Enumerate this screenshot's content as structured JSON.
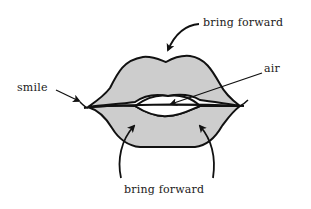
{
  "diagram": {
    "labels": {
      "top": "bring forward",
      "air": "air",
      "smile": "smile",
      "bottom": "bring forward"
    },
    "colors": {
      "lip_fill": "#cfcfcf",
      "outline": "#111111",
      "mouth_opening": "#ffffff",
      "background": "#ffffff"
    }
  }
}
